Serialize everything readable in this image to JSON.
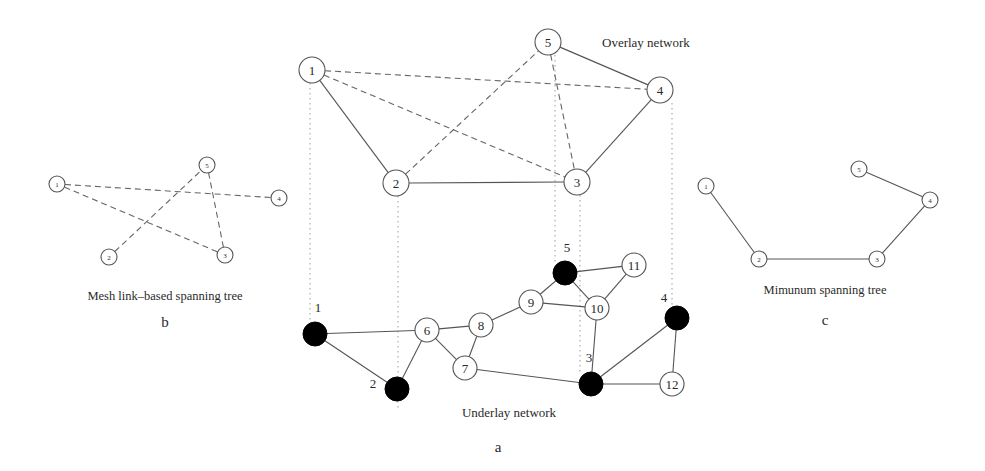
{
  "figure": {
    "panel_a": {
      "caption": "a",
      "overlay_title": "Overlay network",
      "underlay_title": "Underlay network",
      "overlay_nodes": [
        {
          "id": "1",
          "label": "1",
          "x": 312,
          "y": 70,
          "r": 13
        },
        {
          "id": "2",
          "label": "2",
          "x": 396,
          "y": 183,
          "r": 13
        },
        {
          "id": "3",
          "label": "3",
          "x": 577,
          "y": 182,
          "r": 13
        },
        {
          "id": "4",
          "label": "4",
          "x": 660,
          "y": 90,
          "r": 13
        },
        {
          "id": "5",
          "label": "5",
          "x": 548,
          "y": 42,
          "r": 13
        }
      ],
      "overlay_solid_edges": [
        [
          "1",
          "2"
        ],
        [
          "2",
          "3"
        ],
        [
          "3",
          "4"
        ],
        [
          "4",
          "5"
        ]
      ],
      "overlay_dashed_edges": [
        [
          "1",
          "4"
        ],
        [
          "1",
          "3"
        ],
        [
          "2",
          "5"
        ],
        [
          "5",
          "3"
        ]
      ],
      "underlay_nodes": [
        {
          "id": "1",
          "label": "1",
          "x": 315,
          "y": 334,
          "r": 12,
          "filled": true,
          "label_x": 318,
          "label_y": 312
        },
        {
          "id": "2",
          "label": "2",
          "x": 397,
          "y": 389,
          "r": 12,
          "filled": true,
          "label_x": 373,
          "label_y": 388
        },
        {
          "id": "3",
          "label": "3",
          "x": 591,
          "y": 384,
          "r": 12,
          "filled": true,
          "label_x": 589,
          "label_y": 362
        },
        {
          "id": "4",
          "label": "4",
          "x": 677,
          "y": 318,
          "r": 12,
          "filled": true,
          "label_x": 664,
          "label_y": 302
        },
        {
          "id": "5",
          "label": "5",
          "x": 565,
          "y": 273,
          "r": 12,
          "filled": true,
          "label_x": 567,
          "label_y": 252
        },
        {
          "id": "6",
          "label": "6",
          "x": 427,
          "y": 330,
          "r": 12,
          "filled": false
        },
        {
          "id": "7",
          "label": "7",
          "x": 465,
          "y": 368,
          "r": 12,
          "filled": false
        },
        {
          "id": "8",
          "label": "8",
          "x": 481,
          "y": 325,
          "r": 12,
          "filled": false
        },
        {
          "id": "9",
          "label": "9",
          "x": 531,
          "y": 302,
          "r": 12,
          "filled": false
        },
        {
          "id": "10",
          "label": "10",
          "x": 597,
          "y": 308,
          "r": 12,
          "filled": false
        },
        {
          "id": "11",
          "label": "11",
          "x": 634,
          "y": 265,
          "r": 12,
          "filled": false
        },
        {
          "id": "12",
          "label": "12",
          "x": 672,
          "y": 384,
          "r": 12,
          "filled": false
        }
      ],
      "underlay_edges": [
        [
          "1",
          "6"
        ],
        [
          "1",
          "2"
        ],
        [
          "2",
          "6"
        ],
        [
          "6",
          "8"
        ],
        [
          "6",
          "7"
        ],
        [
          "7",
          "8"
        ],
        [
          "8",
          "9"
        ],
        [
          "9",
          "5"
        ],
        [
          "9",
          "10"
        ],
        [
          "5",
          "11"
        ],
        [
          "5",
          "10"
        ],
        [
          "10",
          "11"
        ],
        [
          "10",
          "3"
        ],
        [
          "7",
          "3"
        ],
        [
          "3",
          "4"
        ],
        [
          "3",
          "12"
        ],
        [
          "4",
          "12"
        ]
      ],
      "mapping_lines": [
        {
          "node": "1",
          "x": 310,
          "y1": 83,
          "y2": 322
        },
        {
          "node": "2",
          "x": 398,
          "y1": 196,
          "y2": 410
        },
        {
          "node": "5",
          "x": 555,
          "y1": 55,
          "y2": 262
        },
        {
          "node": "3",
          "x": 580,
          "y1": 195,
          "y2": 372
        },
        {
          "node": "4",
          "x": 672,
          "y1": 103,
          "y2": 306
        }
      ]
    },
    "panel_b": {
      "title": "Mesh link–based spanning tree",
      "caption": "b",
      "nodes": [
        {
          "id": "1",
          "label": "1",
          "x": 57,
          "y": 184,
          "r": 8
        },
        {
          "id": "2",
          "label": "2",
          "x": 109,
          "y": 257,
          "r": 8
        },
        {
          "id": "3",
          "label": "3",
          "x": 225,
          "y": 255,
          "r": 8
        },
        {
          "id": "4",
          "label": "4",
          "x": 279,
          "y": 198,
          "r": 8
        },
        {
          "id": "5",
          "label": "5",
          "x": 207,
          "y": 165,
          "r": 8
        }
      ],
      "dashed_edges": [
        [
          "1",
          "4"
        ],
        [
          "1",
          "3"
        ],
        [
          "2",
          "5"
        ],
        [
          "3",
          "5"
        ]
      ]
    },
    "panel_c": {
      "title": "Mimunum spanning tree",
      "caption": "c",
      "nodes": [
        {
          "id": "1",
          "label": "1",
          "x": 706,
          "y": 186,
          "r": 8
        },
        {
          "id": "2",
          "label": "2",
          "x": 759,
          "y": 259,
          "r": 8
        },
        {
          "id": "3",
          "label": "3",
          "x": 877,
          "y": 259,
          "r": 8
        },
        {
          "id": "4",
          "label": "4",
          "x": 930,
          "y": 200,
          "r": 8
        },
        {
          "id": "5",
          "label": "5",
          "x": 859,
          "y": 169,
          "r": 8
        }
      ],
      "solid_edges": [
        [
          "1",
          "2"
        ],
        [
          "2",
          "3"
        ],
        [
          "3",
          "4"
        ],
        [
          "4",
          "5"
        ]
      ]
    }
  }
}
